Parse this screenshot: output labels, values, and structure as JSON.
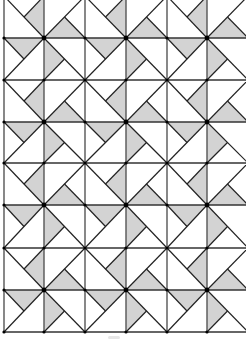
{
  "diagram": {
    "title": "",
    "type": "pinwheel-quilt-tessellation",
    "colors": {
      "background": "#ffffff",
      "shade": "#d3d3d3",
      "line": "#222222",
      "vertex_dot": "#000000"
    },
    "grid": {
      "x_lines": [
        4,
        44,
        85,
        126,
        167,
        207,
        248
      ],
      "y_lines": [
        -4,
        38,
        80,
        122,
        163,
        205,
        248,
        290,
        332
      ],
      "columns": 6,
      "rows": 8
    },
    "block": {
      "description": "2x2 pinwheel block centered on a bold vertex; each cell has one full diagonal through the center and a half-diagonal forming a shaded quarter-triangle",
      "cells": {
        "TL": {
          "diag": [
            [
              0,
              0
            ],
            [
              1,
              1
            ]
          ],
          "half": [
            [
              1,
              0
            ],
            [
              0.5,
              0.5
            ]
          ],
          "shade": [
            [
              1,
              0
            ],
            [
              0.5,
              0.5
            ],
            [
              1,
              1
            ]
          ]
        },
        "TR": {
          "diag": [
            [
              1,
              0
            ],
            [
              0,
              1
            ]
          ],
          "half": [
            [
              1,
              1
            ],
            [
              0.5,
              0.5
            ]
          ],
          "shade": [
            [
              0,
              1
            ],
            [
              0.5,
              0.5
            ],
            [
              1,
              1
            ]
          ]
        },
        "BL": {
          "diag": [
            [
              0,
              1
            ],
            [
              1,
              0
            ]
          ],
          "half": [
            [
              0,
              0
            ],
            [
              0.5,
              0.5
            ]
          ],
          "shade": [
            [
              0,
              0
            ],
            [
              0.5,
              0.5
            ],
            [
              1,
              0
            ]
          ]
        },
        "BR": {
          "diag": [
            [
              0,
              0
            ],
            [
              1,
              1
            ]
          ],
          "half": [
            [
              0,
              1
            ],
            [
              0.5,
              0.5
            ]
          ],
          "shade": [
            [
              0,
              0
            ],
            [
              0.5,
              0.5
            ],
            [
              0,
              1
            ]
          ]
        }
      }
    },
    "smudge_visible": true
  }
}
